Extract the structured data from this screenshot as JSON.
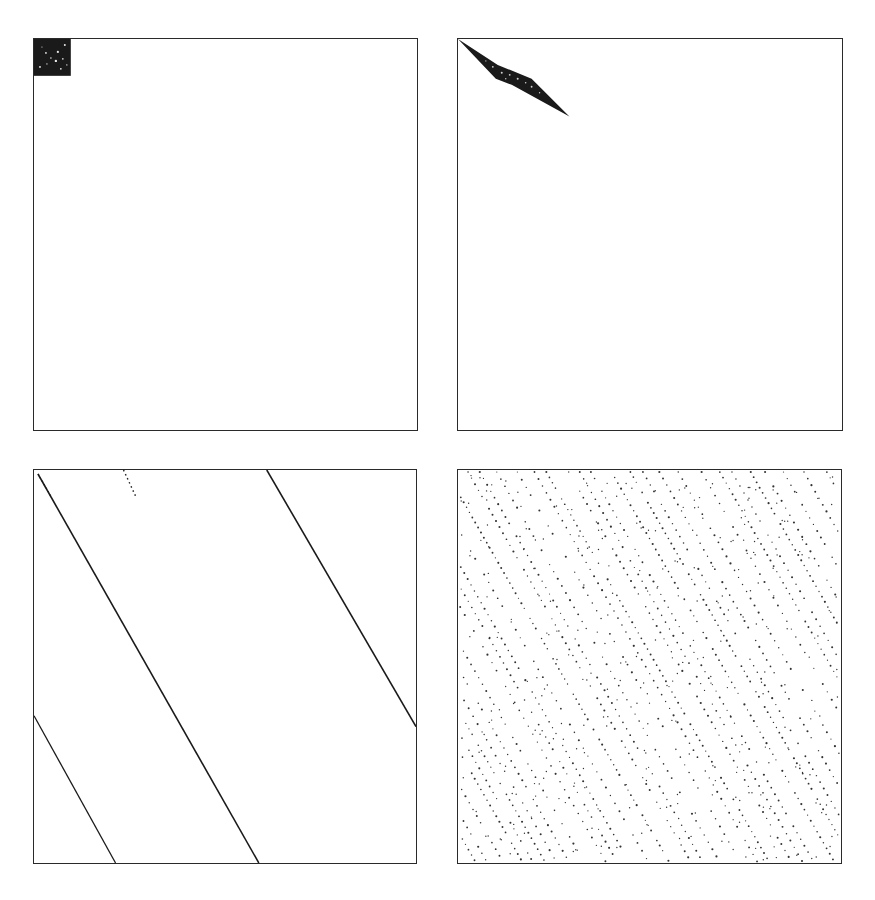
{
  "figure": {
    "layout": "2x2 grid of square scatter/density panels, no axis labels or tick text",
    "border_color": "#2a2a2a",
    "ink_color": "#1a1a1a",
    "background": "#ffffff"
  },
  "chart_data": [
    {
      "type": "scatter",
      "panel": "top-left",
      "title": "",
      "xlabel": "",
      "ylabel": "",
      "grid": false,
      "description": "Dense cluster filling a small square in the top-left corner (approx. 10% of panel width), dark with sparse white speckles; rest empty.",
      "region": {
        "x": [
          0,
          0.1
        ],
        "y": [
          0,
          0.1
        ]
      }
    },
    {
      "type": "scatter",
      "panel": "top-right",
      "title": "",
      "xlabel": "",
      "ylabel": "",
      "grid": false,
      "description": "Dense thin diamond/lens shape from the top-left corner extending diagonally down-right to ~29% width, ~20% height.",
      "polygon": [
        [
          0,
          0
        ],
        [
          0.1,
          0.11
        ],
        [
          0.29,
          0.2
        ],
        [
          0.19,
          0.1
        ]
      ]
    },
    {
      "type": "line",
      "panel": "bottom-left",
      "title": "",
      "xlabel": "",
      "ylabel": "",
      "grid": false,
      "description": "Parallel diagonal lines (wrapping at boundaries), slope descending left-to-right.",
      "segments": [
        {
          "from": [
            0.01,
            0.01
          ],
          "to": [
            0.59,
            1.0
          ]
        },
        {
          "from": [
            0.6,
            0.0
          ],
          "to": [
            1.0,
            0.66
          ]
        },
        {
          "from": [
            0.0,
            0.63
          ],
          "to": [
            0.21,
            1.0
          ]
        },
        {
          "from": [
            0.24,
            0.0
          ],
          "to": [
            0.27,
            0.07
          ],
          "style": "dotted"
        }
      ]
    },
    {
      "type": "scatter",
      "panel": "bottom-right",
      "title": "",
      "xlabel": "",
      "ylabel": "",
      "grid": false,
      "description": "Uniformly spread dotted points arranged in many parallel diagonal streaks descending left-to-right across the whole panel.",
      "streak_slope": 1.75,
      "streak_spacing": 0.045
    }
  ]
}
